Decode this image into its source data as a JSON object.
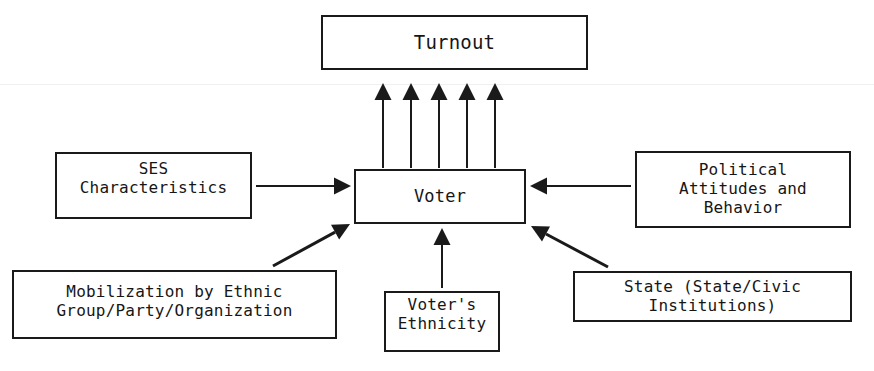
{
  "diagram": {
    "background_color": "#ffffff",
    "line_color": "#1a1a1a",
    "text_color": "#161616",
    "nodes": [
      {
        "id": "turnout",
        "label": "Turnout",
        "x": 321,
        "y": 15,
        "w": 267,
        "h": 55,
        "font_size": 19,
        "pad_bottom": 0
      },
      {
        "id": "ses",
        "label": "SES\nCharacteristics",
        "x": 55,
        "y": 152,
        "w": 197,
        "h": 67,
        "font_size": 16,
        "pad_bottom": 14
      },
      {
        "id": "voter",
        "label": "Voter",
        "x": 354,
        "y": 169,
        "w": 172,
        "h": 55,
        "font_size": 17,
        "pad_bottom": 0
      },
      {
        "id": "political",
        "label": "Political\nAttitudes and\nBehavior",
        "x": 635,
        "y": 151,
        "w": 216,
        "h": 77,
        "font_size": 16,
        "pad_bottom": 0
      },
      {
        "id": "mobilization",
        "label": "Mobilization by Ethnic\nGroup/Party/Organization",
        "x": 12,
        "y": 270,
        "w": 325,
        "h": 69,
        "font_size": 16,
        "pad_bottom": 6
      },
      {
        "id": "ethnicity",
        "label": "Voter's\nEthnicity",
        "x": 384,
        "y": 291,
        "w": 116,
        "h": 61,
        "font_size": 16,
        "pad_bottom": 14
      },
      {
        "id": "state",
        "label": "State (State/Civic\nInstitutions)",
        "x": 573,
        "y": 271,
        "w": 279,
        "h": 51,
        "font_size": 16,
        "pad_bottom": 0
      }
    ],
    "edges": [
      {
        "id": "voter-to-turnout-1",
        "from": "voter",
        "to": "turnout",
        "kind": "vertical-up",
        "x1": 383,
        "y1": 168,
        "x2": 383,
        "y2": 83
      },
      {
        "id": "voter-to-turnout-2",
        "from": "voter",
        "to": "turnout",
        "kind": "vertical-up",
        "x1": 411,
        "y1": 168,
        "x2": 411,
        "y2": 83
      },
      {
        "id": "voter-to-turnout-3",
        "from": "voter",
        "to": "turnout",
        "kind": "vertical-up",
        "x1": 439,
        "y1": 168,
        "x2": 439,
        "y2": 83
      },
      {
        "id": "voter-to-turnout-4",
        "from": "voter",
        "to": "turnout",
        "kind": "vertical-up",
        "x1": 467,
        "y1": 168,
        "x2": 467,
        "y2": 83
      },
      {
        "id": "voter-to-turnout-5",
        "from": "voter",
        "to": "turnout",
        "kind": "vertical-up",
        "x1": 495,
        "y1": 168,
        "x2": 495,
        "y2": 83
      },
      {
        "id": "ses-to-voter",
        "from": "ses",
        "to": "voter",
        "kind": "horizontal-right",
        "x1": 256,
        "y1": 186,
        "x2": 351,
        "y2": 186
      },
      {
        "id": "political-to-voter",
        "from": "political",
        "to": "voter",
        "kind": "horizontal-left",
        "x1": 631,
        "y1": 186,
        "x2": 530,
        "y2": 186
      },
      {
        "id": "mobilization-to-voter",
        "from": "mobilization",
        "to": "voter",
        "kind": "diagonal-up-right",
        "x1": 273,
        "y1": 266,
        "x2": 350,
        "y2": 224
      },
      {
        "id": "ethnicity-to-voter",
        "from": "ethnicity",
        "to": "voter",
        "kind": "vertical-up",
        "x1": 442,
        "y1": 288,
        "x2": 442,
        "y2": 228
      },
      {
        "id": "state-to-voter",
        "from": "state",
        "to": "voter",
        "kind": "diagonal-up-left",
        "x1": 608,
        "y1": 267,
        "x2": 531,
        "y2": 226
      }
    ]
  }
}
